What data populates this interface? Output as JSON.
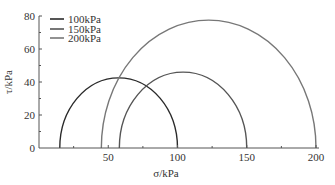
{
  "chart_data": {
    "type": "line",
    "subtype": "mohr-circles",
    "title": "",
    "xlabel": "σ/kPa",
    "ylabel": "τ/kPa",
    "xlim": [
      0,
      200
    ],
    "ylim": [
      0,
      80
    ],
    "x_ticks": [
      50,
      100,
      150,
      200
    ],
    "x_tick_labels": [
      "50",
      "100",
      "150",
      "200"
    ],
    "y_ticks": [
      0,
      20,
      40,
      60,
      80
    ],
    "y_tick_labels": [
      "0",
      "20",
      "40",
      "60",
      "80"
    ],
    "grid": false,
    "legend_position": "upper-left",
    "series": [
      {
        "name": "100kPa",
        "sigma_min": 15,
        "sigma_max": 100,
        "center": 57.5,
        "radius": 42.5,
        "color": "#2a2a2a"
      },
      {
        "name": "150kPa",
        "sigma_min": 58,
        "sigma_max": 150,
        "center": 104,
        "radius": 46,
        "color": "#555555"
      },
      {
        "name": "200kPa",
        "sigma_min": 45,
        "sigma_max": 200,
        "center": 122.5,
        "radius": 77.5,
        "color": "#777777"
      }
    ]
  },
  "legend": {
    "items": [
      {
        "label": "100kPa",
        "color": "#2a2a2a"
      },
      {
        "label": "150kPa",
        "color": "#555555"
      },
      {
        "label": "200kPa",
        "color": "#777777"
      }
    ]
  },
  "axes": {
    "x_title": "σ/kPa",
    "y_title": "τ/kPa"
  }
}
